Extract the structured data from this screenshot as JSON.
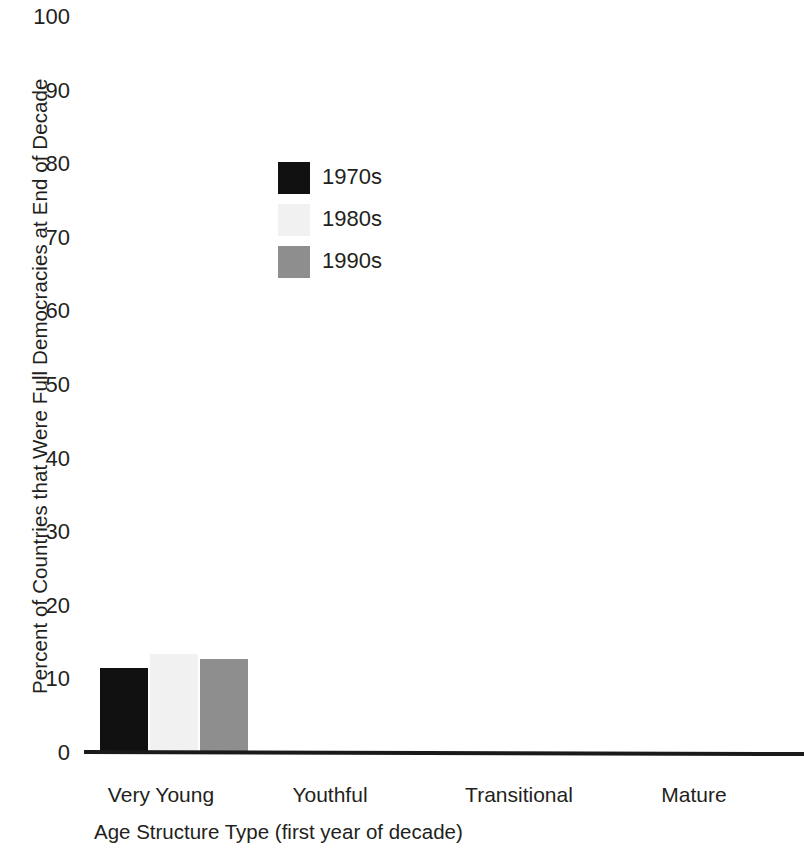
{
  "chart_data": {
    "type": "bar",
    "title": "",
    "xlabel": "Age Structure Type (first year of decade)",
    "ylabel": "Percent of Countries that Were Full Democracies at End of Decade",
    "categories": [
      "Very Young",
      "Youthful",
      "Transitional",
      "Mature"
    ],
    "series": [
      {
        "name": "1970s",
        "color": "#111111",
        "values": [
          11.5,
          0,
          0,
          0
        ]
      },
      {
        "name": "1980s",
        "color": "#f1f1f1",
        "values": [
          13.5,
          0,
          0,
          0
        ]
      },
      {
        "name": "1990s",
        "color": "#8e8e8e",
        "values": [
          12.8,
          0,
          0,
          0
        ]
      }
    ],
    "ylim": [
      0,
      100
    ],
    "yticks": [
      0,
      10,
      20,
      30,
      40,
      50,
      60,
      70,
      80,
      90,
      100
    ],
    "ytick_labels": [
      "0",
      "10",
      "20",
      "30",
      "40",
      "50",
      "60",
      "70",
      "80",
      "90",
      "100"
    ],
    "grid": false,
    "legend_position": "upper-left-inside"
  },
  "axes": {
    "y_title": "Percent of Countries that Were Full Democracies at End of Decade",
    "x_title": "Age Structure Type (first year of decade)"
  },
  "legend": {
    "entries": [
      {
        "label": "1970s",
        "color": "#111111"
      },
      {
        "label": "1980s",
        "color": "#f1f1f1"
      },
      {
        "label": "1990s",
        "color": "#8e8e8e"
      }
    ]
  },
  "colors": {
    "decade_1970s": "#111111",
    "decade_1980s": "#f1f1f1",
    "decade_1990s": "#8e8e8e",
    "axis": "#1a1a1a",
    "text": "#231f20",
    "background": "#ffffff"
  }
}
